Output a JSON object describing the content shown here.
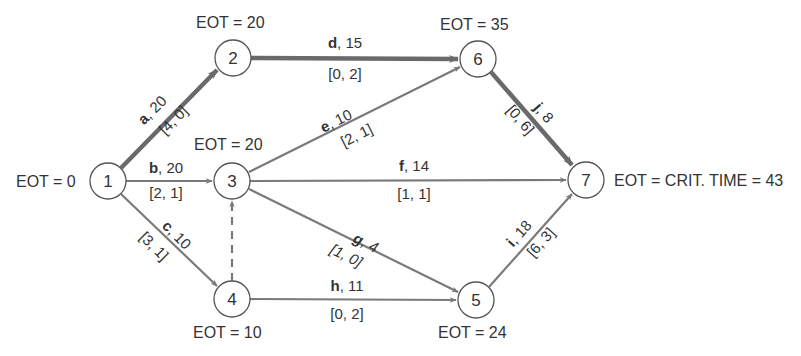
{
  "diagram": {
    "type": "activity-on-arrow network",
    "nodes": [
      {
        "id": "1",
        "x": 108,
        "y": 181,
        "eot": "EOT = 0"
      },
      {
        "id": "2",
        "x": 233,
        "y": 58,
        "eot": "EOT = 20"
      },
      {
        "id": "3",
        "x": 232,
        "y": 181,
        "eot": "EOT = 20"
      },
      {
        "id": "4",
        "x": 232,
        "y": 299,
        "eot": "EOT = 10"
      },
      {
        "id": "5",
        "x": 476,
        "y": 300,
        "eot": "EOT = 24"
      },
      {
        "id": "6",
        "x": 478,
        "y": 59,
        "eot": "EOT = 35"
      },
      {
        "id": "7",
        "x": 586,
        "y": 180,
        "eot": "EOT = CRIT. TIME = 43"
      }
    ],
    "edges": [
      {
        "activity": "a",
        "duration": ", 20",
        "bracket": "[4, 0]",
        "from": "1",
        "to": "2",
        "critical": true
      },
      {
        "activity": "b",
        "duration": ", 20",
        "bracket": "[2, 1]",
        "from": "1",
        "to": "3",
        "critical": false
      },
      {
        "activity": "c",
        "duration": ", 10",
        "bracket": "[3, 1]",
        "from": "1",
        "to": "4",
        "critical": false
      },
      {
        "activity": "d",
        "duration": ", 15",
        "bracket": "[0, 2]",
        "from": "2",
        "to": "6",
        "critical": true
      },
      {
        "activity": "e",
        "duration": ", 10",
        "bracket": "[2, 1]",
        "from": "3",
        "to": "6",
        "critical": false
      },
      {
        "activity": "f",
        "duration": ", 14",
        "bracket": "[1, 1]",
        "from": "3",
        "to": "7",
        "critical": false
      },
      {
        "activity": "g",
        "duration": ", 4",
        "bracket": "[1, 0]",
        "from": "3",
        "to": "5",
        "critical": false
      },
      {
        "activity": "h",
        "duration": ", 11",
        "bracket": "[0, 2]",
        "from": "4",
        "to": "5",
        "critical": false
      },
      {
        "activity": "i",
        "duration": ", 18",
        "bracket": "[6, 3]",
        "from": "5",
        "to": "7",
        "critical": false
      },
      {
        "activity": "j",
        "duration": ", 8",
        "bracket": "[0, 6]",
        "from": "6",
        "to": "7",
        "critical": true
      },
      {
        "activity": "",
        "duration": "",
        "bracket": "",
        "from": "4",
        "to": "3",
        "critical": false,
        "dummy": true
      }
    ]
  },
  "colors": {
    "critical_edge": "#6a6a6a",
    "edge": "#7a7a7a",
    "node_stroke": "#555555",
    "text": "#333333"
  }
}
